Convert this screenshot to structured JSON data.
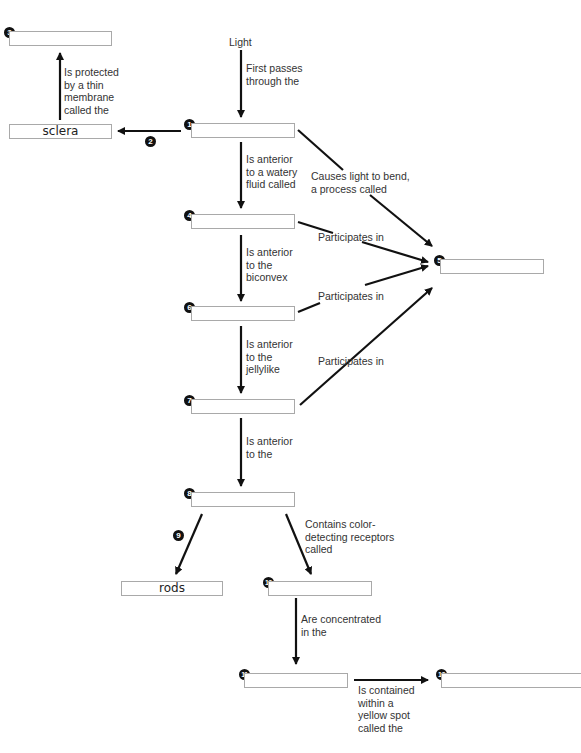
{
  "start_label": "Light",
  "nodes": [
    {
      "id": "1",
      "value": ""
    },
    {
      "id": "2",
      "value": "sclera"
    },
    {
      "id": "3",
      "value": ""
    },
    {
      "id": "4",
      "value": ""
    },
    {
      "id": "5",
      "value": ""
    },
    {
      "id": "6",
      "value": ""
    },
    {
      "id": "7",
      "value": ""
    },
    {
      "id": "8",
      "value": ""
    },
    {
      "id": "9",
      "value": "rods"
    },
    {
      "id": "10",
      "value": ""
    },
    {
      "id": "11",
      "value": ""
    },
    {
      "id": "12",
      "value": ""
    }
  ],
  "markers": {
    "n1": "1",
    "n2": "2",
    "n3": "3",
    "n4": "4",
    "n5": "5",
    "n6": "6",
    "n7": "7",
    "n8": "8",
    "n9": "9",
    "n10": "10",
    "n11": "11",
    "n12": "12"
  },
  "links": {
    "light_to_1": "First passes\nthrough the",
    "sclera_to_3": "Is protected\nby a thin\nmembrane\ncalled the",
    "n1_to_4": "Is anterior\nto a watery\nfluid called",
    "n1_to_5": "Causes light to bend,\na process called",
    "n4_to_5": "Participates in",
    "n4_to_6": "Is anterior\nto the\nbiconvex",
    "n6_to_5": "Participates in",
    "n6_to_7": "Is anterior\nto the\njellylike",
    "n7_to_5": "Participates in",
    "n7_to_8": "Is anterior\nto the",
    "n8_to_10": "Contains color-\ndetecting receptors\ncalled",
    "n10_to_11": "Are concentrated\nin the",
    "n11_to_12": "Is contained\nwithin a\nyellow spot\ncalled the"
  },
  "colors": {
    "box_border": "#a9a9a9",
    "arrow": "#111111",
    "marker": "#111111"
  }
}
